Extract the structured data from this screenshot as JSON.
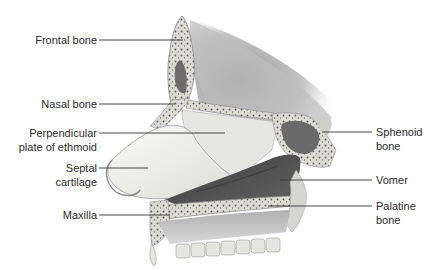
{
  "diagram": {
    "type": "anatomical-illustration",
    "colors": {
      "background": "#ffffff",
      "bone": "#dcdcd6",
      "bone_dots": "#5a5a5a",
      "cartilage": "#efefec",
      "sinus": "#6e6e6e",
      "vomer": "#4a4a4a",
      "skull_shade": "#b8b8b8",
      "leader_line": "#333333",
      "text": "#2b2b2b"
    },
    "labels": {
      "frontal_bone": {
        "line1": "Frontal bone",
        "line2": ""
      },
      "nasal_bone": {
        "line1": "Nasal bone",
        "line2": ""
      },
      "perpendicular_plate": {
        "line1": "Perpendicular",
        "line2": "plate of ethmoid"
      },
      "septal_cartilage": {
        "line1": "Septal",
        "line2": "cartilage"
      },
      "maxilla": {
        "line1": "Maxilla",
        "line2": ""
      },
      "sphenoid_bone": {
        "line1": "Sphenoid",
        "line2": "bone"
      },
      "vomer": {
        "line1": "Vomer",
        "line2": ""
      },
      "palatine_bone": {
        "line1": "Palatine",
        "line2": "bone"
      }
    }
  }
}
